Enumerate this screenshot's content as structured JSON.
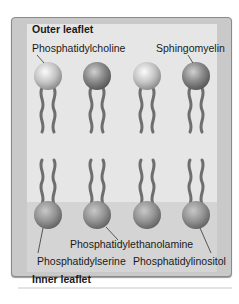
{
  "figure": {
    "regions": {
      "outer_label": "Outer leaflet",
      "inner_label": "Inner leaflet"
    },
    "outer_labels": {
      "left": "Phosphatidylcholine",
      "right": "Sphingomyelin"
    },
    "inner_labels": {
      "middle": "Phosphatidylethanolamine",
      "left": "Phosphatidylserine",
      "right": "Phosphatidylinositol"
    },
    "colors": {
      "frame": "#c9c9c9",
      "panel": "#e6e6e6",
      "inner_band": "#d4d4d4",
      "tail": "#6e6e6e",
      "head_light": "#d8d8d8",
      "head_dark": "#8c8c8c"
    }
  }
}
